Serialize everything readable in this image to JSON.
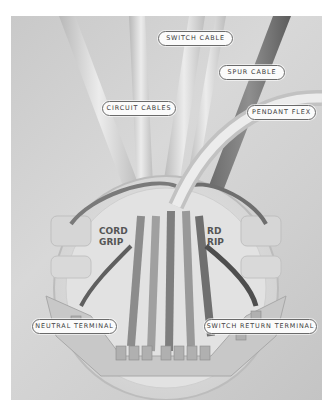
{
  "figure": {
    "embossed_text": [
      "CORD GRIP",
      "CORD GRIP"
    ],
    "labels": [
      {
        "id": "switch-cable",
        "text": "SWITCH CABLE"
      },
      {
        "id": "spur-cable",
        "text": "SPUR CABLE"
      },
      {
        "id": "circuit-cables",
        "text": "CIRCUIT CABLES"
      },
      {
        "id": "pendant-flex",
        "text": "PENDANT FLEX"
      },
      {
        "id": "neutral-terminal",
        "text": "NEUTRAL TERMINAL"
      },
      {
        "id": "switch-return-terminal",
        "text": "SWITCH RETURN TERMINAL"
      }
    ]
  }
}
